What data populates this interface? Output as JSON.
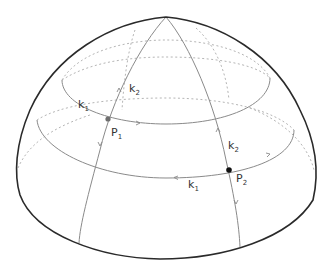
{
  "figure": {
    "type": "hemisphere-lines-of-curvature",
    "colors": {
      "outline": "#2a2a2a",
      "curve": "#8a8a8a",
      "hidden_curve": "#b5b5b5",
      "point_p1": "#6f6f6f",
      "point_p2": "#111111",
      "text": "#333333"
    },
    "labels": {
      "k1_upper": {
        "main": "k",
        "sub": "1"
      },
      "k2_upper": {
        "main": "k",
        "sub": "2"
      },
      "p1": {
        "main": "P",
        "sub": "1"
      },
      "k2_lower": {
        "main": "k",
        "sub": "2"
      },
      "p2": {
        "main": "P",
        "sub": "2"
      },
      "k1_lower": {
        "main": "k",
        "sub": "1"
      }
    },
    "points": [
      {
        "name": "P1",
        "x": 108,
        "y": 119
      },
      {
        "name": "P2",
        "x": 229,
        "y": 170
      }
    ]
  }
}
